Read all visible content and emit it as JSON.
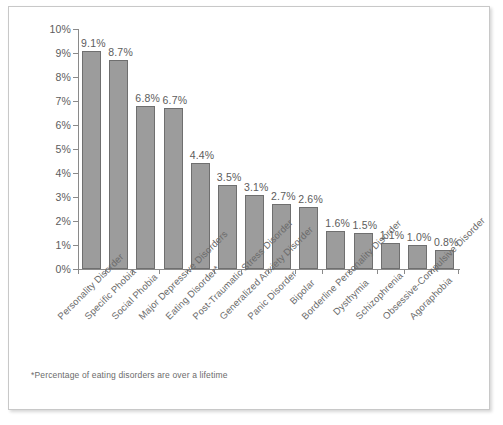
{
  "chart_data": {
    "type": "bar",
    "title": "",
    "xlabel": "",
    "ylabel": "",
    "ylim": [
      0,
      10
    ],
    "grid": false,
    "legend": null,
    "categories": [
      "Personality Disorder",
      "Specific Phobia",
      "Social Phobia",
      "Major Depressive Disorders",
      "Eating Disorder*",
      "Post-Traumatic Stress Disorder",
      "Generalized Anxiety Disorder",
      "Panic Disorder",
      "Bipolar",
      "Borderline Personality Disorder",
      "Dysthymia",
      "Schizophrenia",
      "Obsessive-Compulsive Disorder",
      "Agoraphobia"
    ],
    "values": [
      9.1,
      8.7,
      6.8,
      6.7,
      4.4,
      3.5,
      3.1,
      2.7,
      2.6,
      1.6,
      1.5,
      1.1,
      1.0,
      0.8
    ],
    "value_labels": [
      "9.1%",
      "8.7%",
      "6.8%",
      "6.7%",
      "4.4%",
      "3.5%",
      "3.1%",
      "2.7%",
      "2.6%",
      "1.6%",
      "1.5%",
      "1.1%",
      "1.0%",
      "0.8%"
    ],
    "y_ticks": [
      0,
      1,
      2,
      3,
      4,
      5,
      6,
      7,
      8,
      9,
      10
    ],
    "y_tick_labels": [
      "0%",
      "1%",
      "2%",
      "3%",
      "4%",
      "5%",
      "6%",
      "7%",
      "8%",
      "9%",
      "10%"
    ],
    "bar_color": "#9c9c9c",
    "bar_edge_color": "#6f6f6f",
    "axis_color": "#8a8a8a",
    "text_color": "#5c5c5c"
  },
  "footnote": "*Percentage of eating disorders are over a lifetime"
}
